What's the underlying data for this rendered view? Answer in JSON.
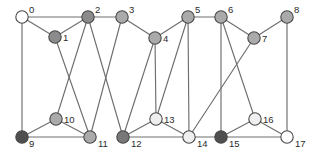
{
  "figure": {
    "kind": "undirected-graph-drawing",
    "width": 318,
    "height": 159,
    "background": "#ffffff",
    "edge_color": "#6e6e6e",
    "node_outline_color": "#4a4a4a",
    "label_color": "#2b2b2b",
    "node_radius": 6.2
  },
  "palette": {
    "white": "#ffffff",
    "very_light_gray": "#efefef",
    "light_gray": "#d4d4d4",
    "medium_gray": "#aaaaaa",
    "mid_dark_gray": "#8b8b8b",
    "dark_gray": "#787878",
    "darkest_gray": "#4f4f4f"
  },
  "nodes": [
    {
      "id": 0,
      "label": "0",
      "x": 22,
      "y": 17,
      "fill": "#ffffff",
      "label_dx": 7,
      "label_dy": -4
    },
    {
      "id": 1,
      "label": "1",
      "x": 55,
      "y": 37,
      "fill": "#8b8b8b",
      "label_dx": 8,
      "label_dy": 4
    },
    {
      "id": 2,
      "label": "2",
      "x": 88,
      "y": 17,
      "fill": "#8b8b8b",
      "label_dx": 7,
      "label_dy": -4
    },
    {
      "id": 3,
      "label": "3",
      "x": 122,
      "y": 17,
      "fill": "#aaaaaa",
      "label_dx": 7,
      "label_dy": -4
    },
    {
      "id": 4,
      "label": "4",
      "x": 155,
      "y": 38,
      "fill": "#aaaaaa",
      "label_dx": 8,
      "label_dy": 4
    },
    {
      "id": 5,
      "label": "5",
      "x": 188,
      "y": 17,
      "fill": "#aaaaaa",
      "label_dx": 7,
      "label_dy": -4
    },
    {
      "id": 6,
      "label": "6",
      "x": 221,
      "y": 17,
      "fill": "#aaaaaa",
      "label_dx": 7,
      "label_dy": -4
    },
    {
      "id": 7,
      "label": "7",
      "x": 254,
      "y": 38,
      "fill": "#aaaaaa",
      "label_dx": 8,
      "label_dy": 4
    },
    {
      "id": 8,
      "label": "8",
      "x": 287,
      "y": 17,
      "fill": "#aaaaaa",
      "label_dx": 7,
      "label_dy": -4
    },
    {
      "id": 9,
      "label": "9",
      "x": 22,
      "y": 137,
      "fill": "#4f4f4f",
      "label_dx": 7,
      "label_dy": 10
    },
    {
      "id": 10,
      "label": "10",
      "x": 56,
      "y": 119,
      "fill": "#aaaaaa",
      "label_dx": 8,
      "label_dy": 4
    },
    {
      "id": 11,
      "label": "11",
      "x": 90,
      "y": 137,
      "fill": "#aaaaaa",
      "label_dx": 8,
      "label_dy": 10
    },
    {
      "id": 12,
      "label": "12",
      "x": 123,
      "y": 137,
      "fill": "#787878",
      "label_dx": 8,
      "label_dy": 10
    },
    {
      "id": 13,
      "label": "13",
      "x": 156,
      "y": 119,
      "fill": "#efefef",
      "label_dx": 8,
      "label_dy": 4
    },
    {
      "id": 14,
      "label": "14",
      "x": 189,
      "y": 137,
      "fill": "#efefef",
      "label_dx": 8,
      "label_dy": 10
    },
    {
      "id": 15,
      "label": "15",
      "x": 221,
      "y": 137,
      "fill": "#4f4f4f",
      "label_dx": 8,
      "label_dy": 10
    },
    {
      "id": 16,
      "label": "16",
      "x": 255,
      "y": 119,
      "fill": "#efefef",
      "label_dx": 8,
      "label_dy": 4
    },
    {
      "id": 17,
      "label": "17",
      "x": 287,
      "y": 137,
      "fill": "#ffffff",
      "label_dx": 8,
      "label_dy": 10
    }
  ],
  "edges": [
    {
      "source": 0,
      "target": 1
    },
    {
      "source": 0,
      "target": 2
    },
    {
      "source": 0,
      "target": 9
    },
    {
      "source": 1,
      "target": 2
    },
    {
      "source": 1,
      "target": 11
    },
    {
      "source": 2,
      "target": 3
    },
    {
      "source": 2,
      "target": 12
    },
    {
      "source": 3,
      "target": 4
    },
    {
      "source": 3,
      "target": 11
    },
    {
      "source": 4,
      "target": 5
    },
    {
      "source": 4,
      "target": 13
    },
    {
      "source": 5,
      "target": 6
    },
    {
      "source": 5,
      "target": 14
    },
    {
      "source": 6,
      "target": 7
    },
    {
      "source": 6,
      "target": 15
    },
    {
      "source": 7,
      "target": 8
    },
    {
      "source": 7,
      "target": 14
    },
    {
      "source": 8,
      "target": 17
    },
    {
      "source": 9,
      "target": 10
    },
    {
      "source": 9,
      "target": 11
    },
    {
      "source": 10,
      "target": 11
    },
    {
      "source": 10,
      "target": 2
    },
    {
      "source": 12,
      "target": 13
    },
    {
      "source": 12,
      "target": 14
    },
    {
      "source": 13,
      "target": 14
    },
    {
      "source": 14,
      "target": 15
    },
    {
      "source": 15,
      "target": 16
    },
    {
      "source": 15,
      "target": 17
    },
    {
      "source": 16,
      "target": 17
    },
    {
      "source": 16,
      "target": 6
    },
    {
      "source": 13,
      "target": 5
    },
    {
      "source": 12,
      "target": 4
    }
  ]
}
